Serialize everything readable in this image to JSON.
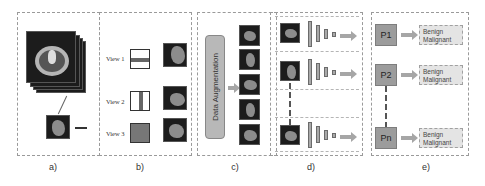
{
  "panels": {
    "a": {
      "label": "a)"
    },
    "b": {
      "label": "b)",
      "views": [
        "View 1",
        "View 2",
        "View 3"
      ]
    },
    "c": {
      "label": "c)",
      "augmentation_label": "Data Augmentation"
    },
    "d": {
      "label": "d)"
    },
    "e": {
      "label": "e)",
      "rows": [
        {
          "patient": "P1",
          "class1": "Benign",
          "class2": "Malignant"
        },
        {
          "patient": "P2",
          "class1": "Benign",
          "class2": "Malignant"
        },
        {
          "patient": "Pn",
          "class1": "Benign",
          "class2": "Malignant"
        }
      ]
    }
  },
  "colors": {
    "panel_border": "#9a9a9a",
    "patient_box": "#9c9c9c",
    "result_box": "#e4e4e4",
    "arrow": "#a6a6a6",
    "ct_background": "#1c1c1c"
  }
}
